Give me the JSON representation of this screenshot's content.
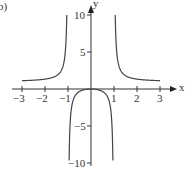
{
  "panel_label": "b)",
  "chart_data": {
    "type": "line",
    "title": "",
    "function": "y = x^2/(x^2 - 1)",
    "xlabel": "x",
    "ylabel": "y",
    "xlim": [
      -3.2,
      3.4
    ],
    "ylim": [
      -10,
      10.5
    ],
    "x_ticks": [
      -3,
      -2,
      -1,
      1,
      2,
      3
    ],
    "x_tick_labels": [
      "−3",
      "−2",
      "−1",
      "1",
      "2",
      "3"
    ],
    "y_ticks": [
      10,
      5,
      -5,
      -10
    ],
    "y_tick_labels": [
      "10",
      "5",
      "−5",
      "−10"
    ],
    "vertical_asymptotes": [
      -1,
      1
    ],
    "horizontal_asymptote": 1,
    "grid": false,
    "legend": null,
    "series": [
      {
        "name": "left branch",
        "x": [
          -3,
          -2.5,
          -2,
          -1.5,
          -1.2,
          -1.1,
          -1.05
        ],
        "y": [
          1.125,
          1.19,
          1.33,
          1.8,
          3.27,
          5.76,
          10.76
        ]
      },
      {
        "name": "middle branch",
        "x": [
          -0.95,
          -0.9,
          -0.8,
          -0.5,
          0,
          0.5,
          0.8,
          0.9,
          0.95
        ],
        "y": [
          -9.26,
          -4.26,
          -1.78,
          -0.33,
          0,
          -0.33,
          -1.78,
          -4.26,
          -9.26
        ]
      },
      {
        "name": "right branch",
        "x": [
          1.05,
          1.1,
          1.2,
          1.5,
          2,
          2.5,
          3
        ],
        "y": [
          10.76,
          5.76,
          3.27,
          1.8,
          1.33,
          1.19,
          1.125
        ]
      }
    ]
  }
}
